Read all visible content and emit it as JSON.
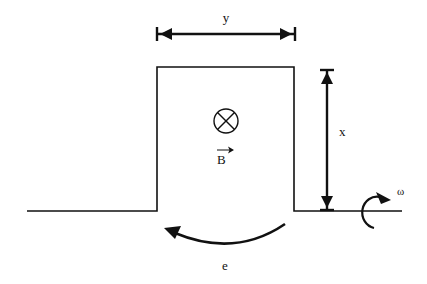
{
  "diagram": {
    "labels": {
      "width": "y",
      "height": "x",
      "field": "B",
      "emf": "e",
      "angular_velocity": "ω"
    },
    "field_symbol": "into-page-cross-circle",
    "colors": {
      "line": "#111111",
      "background": "#ffffff"
    }
  }
}
